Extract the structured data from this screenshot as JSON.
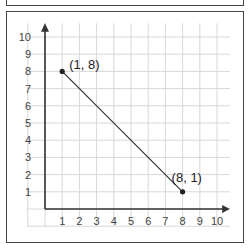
{
  "chart_data": {
    "type": "line",
    "title": "",
    "xlabel": "",
    "ylabel": "",
    "xlim": [
      0,
      10
    ],
    "ylim": [
      0,
      10
    ],
    "grid": true,
    "x_ticks": [
      "1",
      "2",
      "3",
      "4",
      "5",
      "6",
      "7",
      "8",
      "9",
      "10"
    ],
    "y_ticks": [
      "1",
      "2",
      "3",
      "4",
      "5",
      "6",
      "7",
      "8",
      "9",
      "10"
    ],
    "series": [
      {
        "name": "segment",
        "points": [
          {
            "x": 1,
            "y": 8,
            "label": "(1, 8)"
          },
          {
            "x": 8,
            "y": 1,
            "label": "(8, 1)"
          }
        ]
      }
    ],
    "colors": {
      "grid": "#d8d8d8",
      "axis": "#333333",
      "line": "#333333",
      "point": "#222222"
    }
  }
}
